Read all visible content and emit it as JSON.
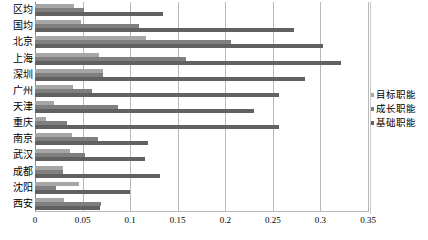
{
  "chart_data": {
    "type": "bar",
    "orientation": "horizontal",
    "title": "",
    "subtitle": "",
    "xlabel": "",
    "ylabel": "",
    "xlim": [
      0,
      0.35
    ],
    "xticks": [
      "0",
      "0.05",
      "0.1",
      "0.15",
      "0.2",
      "0.25",
      "0.3",
      "0.35"
    ],
    "xtick_values": [
      0,
      0.05,
      0.1,
      0.15,
      0.2,
      0.25,
      0.3,
      0.35
    ],
    "grid": "vertical",
    "legend_position": "right",
    "categories": [
      "区均",
      "国均",
      "北京",
      "上海",
      "深圳",
      "广州",
      "天津",
      "重庆",
      "南京",
      "武汉",
      "成都",
      "沈阳",
      "西安"
    ],
    "series": [
      {
        "name": "目标职能",
        "color": "#a6a6a6",
        "values": [
          0.041,
          0.048,
          0.117,
          0.067,
          0.071,
          0.04,
          0.02,
          0.012,
          0.039,
          0.037,
          0.029,
          0.046,
          0.031
        ]
      },
      {
        "name": "成长职能",
        "color": "#7f7f7f",
        "values": [
          0.052,
          0.109,
          0.206,
          0.159,
          0.071,
          0.06,
          0.087,
          0.034,
          0.066,
          0.053,
          0.029,
          0.022,
          0.069
        ]
      },
      {
        "name": "基础职能",
        "color": "#616161",
        "values": [
          0.135,
          0.272,
          0.303,
          0.322,
          0.284,
          0.256,
          0.23,
          0.256,
          0.119,
          0.116,
          0.131,
          0.1,
          0.068
        ]
      }
    ]
  },
  "legend": {
    "items": [
      {
        "label": "目标职能",
        "color": "#a6a6a6"
      },
      {
        "label": "成长职能",
        "color": "#7f7f7f"
      },
      {
        "label": "基础职能",
        "color": "#616161"
      }
    ]
  }
}
